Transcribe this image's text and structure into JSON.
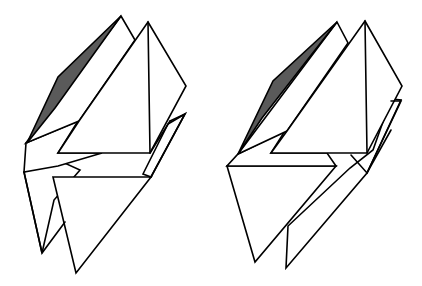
{
  "figure": {
    "background": "#ffffff",
    "stroke_color": "#000000",
    "shade_color": "#5a5a5a",
    "figures": [
      {
        "id": "left-solid",
        "position": "left",
        "shaded_face": "thin left wedge face near top",
        "lower_part": "two separate downward-pointing triangular flaps"
      },
      {
        "id": "right-solid",
        "position": "right",
        "shaded_face": "thin left wedge face near top",
        "lower_part": "one large downward-pointing triangular flap with a narrow strip behind it"
      }
    ]
  }
}
